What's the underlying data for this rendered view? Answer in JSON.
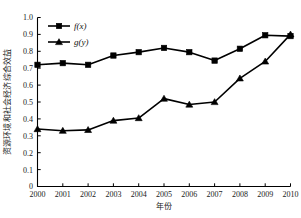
{
  "chart_data": {
    "type": "line",
    "title": "",
    "xlabel": "年份",
    "ylabel": "资源环境和社会经济综合效益",
    "categories": [
      "2000",
      "2001",
      "2002",
      "2003",
      "2004",
      "2005",
      "2006",
      "2007",
      "2008",
      "2009",
      "2010"
    ],
    "x": [
      2000,
      2001,
      2002,
      2003,
      2004,
      2005,
      2006,
      2007,
      2008,
      2009,
      2010
    ],
    "series": [
      {
        "name": "f(x)",
        "marker": "square",
        "color": "#000000",
        "values": [
          0.72,
          0.73,
          0.72,
          0.775,
          0.795,
          0.82,
          0.795,
          0.745,
          0.815,
          0.895,
          0.89
        ]
      },
      {
        "name": "g(y)",
        "marker": "triangle",
        "color": "#000000",
        "values": [
          0.34,
          0.33,
          0.335,
          0.39,
          0.405,
          0.52,
          0.485,
          0.5,
          0.64,
          0.74,
          0.9
        ]
      }
    ],
    "ylim": [
      0,
      1.0
    ],
    "ytick_step": 0.1,
    "ytick_labels": [
      "0",
      "0.1",
      "0.2",
      "0.3",
      "0.4",
      "0.5",
      "0.6",
      "0.7",
      "0.8",
      "0.9",
      "1.0"
    ],
    "grid": false,
    "legend_position": "top-left-inside"
  },
  "legend": {
    "entries": [
      {
        "label": "f(x)"
      },
      {
        "label": "g(y)"
      }
    ]
  },
  "axes": {
    "y_title": "资源环境和社会经济综合效益",
    "x_title": "年份"
  }
}
